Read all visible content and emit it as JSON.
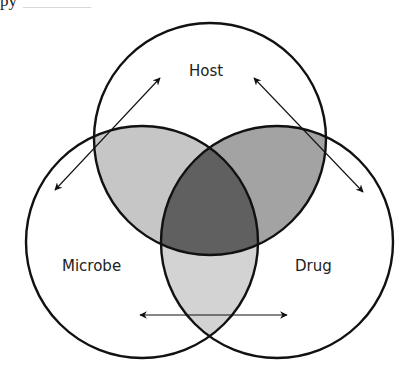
{
  "header_fragment": {
    "text": "py",
    "faint_text": "________"
  },
  "diagram": {
    "type": "venn-3",
    "sets": [
      {
        "id": "host",
        "label": "Host",
        "cx": 210,
        "cy": 139,
        "r": 116
      },
      {
        "id": "microbe",
        "label": "Microbe",
        "cx": 142,
        "cy": 242,
        "r": 116
      },
      {
        "id": "drug",
        "label": "Drug",
        "cx": 277,
        "cy": 242,
        "r": 116
      }
    ],
    "intersections": [
      {
        "sets": [
          "host",
          "microbe"
        ],
        "color": "#c6c6c6"
      },
      {
        "sets": [
          "host",
          "drug"
        ],
        "color": "#a3a3a3"
      },
      {
        "sets": [
          "microbe",
          "drug"
        ],
        "color": "#d3d3d3"
      },
      {
        "sets": [
          "host",
          "microbe",
          "drug"
        ],
        "color": "#606060"
      }
    ],
    "arrows": [
      {
        "name": "host-microbe-arrow",
        "from": [
          160,
          78
        ],
        "to": [
          55,
          190
        ],
        "bidirectional": true
      },
      {
        "name": "host-drug-arrow",
        "from": [
          254,
          78
        ],
        "to": [
          363,
          192
        ],
        "bidirectional": true
      },
      {
        "name": "microbe-drug-arrow",
        "from": [
          140,
          315
        ],
        "to": [
          287,
          315
        ],
        "bidirectional": true
      }
    ],
    "stroke_color": "#111111"
  }
}
